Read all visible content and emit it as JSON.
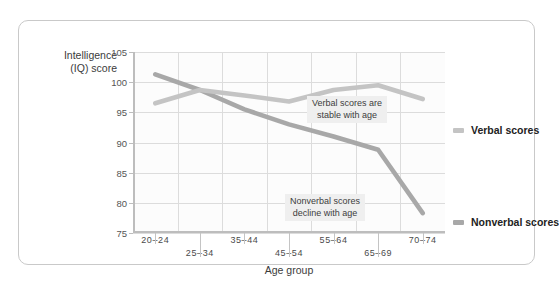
{
  "chart_data": {
    "type": "line",
    "title": "",
    "xlabel": "Age group",
    "ylabel": "Intelligence\n(IQ) score",
    "categories": [
      "20–24",
      "25–34",
      "35–44",
      "45–54",
      "55–64",
      "65–69",
      "70–74"
    ],
    "ylim": [
      75,
      105
    ],
    "ytick_labels": [
      "105",
      "100",
      "95",
      "90",
      "85",
      "80",
      "75"
    ],
    "ytick_values": [
      105,
      100,
      95,
      90,
      85,
      80,
      75
    ],
    "grid": true,
    "legend_position": "right",
    "series": [
      {
        "name": "Verbal scores",
        "color": "#c4c4c4",
        "values": [
          96.5,
          98.7,
          97.8,
          96.8,
          98.7,
          99.5,
          97.2
        ]
      },
      {
        "name": "Nonverbal scores",
        "color": "#a8a8a8",
        "values": [
          101.3,
          98.7,
          95.5,
          93.0,
          91.0,
          88.8,
          78.3
        ]
      }
    ],
    "annotations": [
      {
        "id": "verbal-note",
        "text": "Verbal scores are\nstable with age"
      },
      {
        "id": "nonverbal-note",
        "text": "Nonverbal scores\ndecline with age"
      }
    ]
  },
  "legend": {
    "items": [
      {
        "label": "Verbal scores",
        "color": "#c4c4c4"
      },
      {
        "label": "Nonverbal scores",
        "color": "#a8a8a8"
      }
    ]
  },
  "colors": {
    "verbal_line": "#c4c4c4",
    "nonverbal_line": "#a8a8a8",
    "gridline": "#dcdcdc",
    "axis": "#bdbdbd",
    "card_border": "#c9c9c9",
    "annotation_bg": "#efefef",
    "plot_bg": "#fcfcfc"
  }
}
